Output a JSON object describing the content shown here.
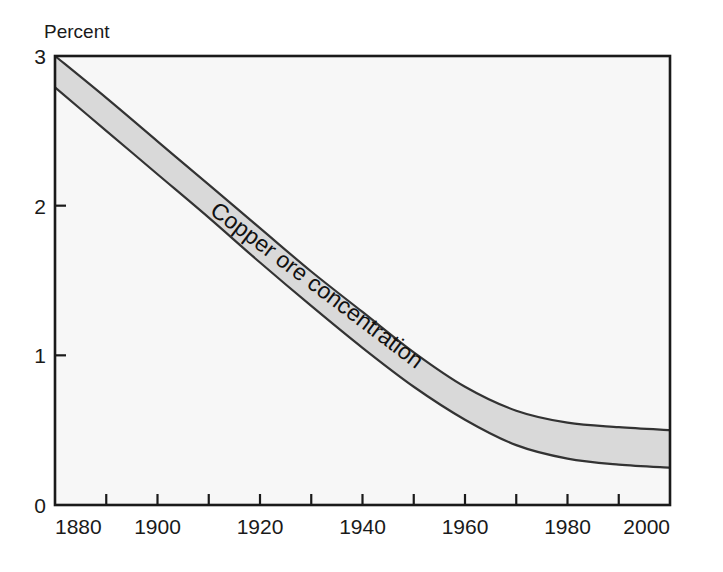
{
  "chart_data": {
    "type": "area",
    "title": "",
    "subtitle": "",
    "xlabel": "",
    "ylabel": "Percent",
    "ylabel_position": "top-left",
    "xlim": [
      1880,
      2000
    ],
    "ylim": [
      0,
      3
    ],
    "grid": false,
    "legend": false,
    "legend_position": "none",
    "annotations": [
      {
        "text": "Copper ore concentration",
        "rotation_deg": 37,
        "x": 1910,
        "y": 1.95,
        "placement": "inside-band"
      }
    ],
    "x_tick_labels": [
      "1880",
      "1900",
      "1920",
      "1940",
      "1960",
      "1980",
      "2000"
    ],
    "x_tick_values": [
      1880,
      1900,
      1920,
      1940,
      1960,
      1980,
      2000
    ],
    "x_minor_tick_values": [
      1890,
      1910,
      1930,
      1950,
      1970,
      1990
    ],
    "y_tick_labels": [
      "0",
      "1",
      "2",
      "3"
    ],
    "y_tick_values": [
      0,
      1,
      2,
      3
    ],
    "x": [
      1880,
      1890,
      1900,
      1910,
      1920,
      1930,
      1940,
      1950,
      1960,
      1970,
      1980,
      1990,
      2000
    ],
    "series": [
      {
        "name": "Copper ore concentration upper bound",
        "values": [
          3.0,
          2.72,
          2.43,
          2.14,
          1.85,
          1.56,
          1.29,
          1.02,
          0.79,
          0.63,
          0.55,
          0.52,
          0.5
        ]
      },
      {
        "name": "Copper ore concentration lower bound",
        "values": [
          2.79,
          2.5,
          2.21,
          1.92,
          1.62,
          1.33,
          1.05,
          0.79,
          0.57,
          0.4,
          0.31,
          0.27,
          0.25
        ]
      }
    ],
    "band_fill_color": "#d9d9d9",
    "band_edge_color": "#333333",
    "plot_background_color": "#f7f7f7",
    "axis_color": "#1a1a1a"
  },
  "axis": {
    "y_title": "Percent",
    "y_ticks": [
      "3",
      "2",
      "1",
      "0"
    ],
    "x_ticks": [
      "1880",
      "1900",
      "1920",
      "1940",
      "1960",
      "1980",
      "2000"
    ]
  },
  "band": {
    "label": "Copper ore concentration"
  }
}
